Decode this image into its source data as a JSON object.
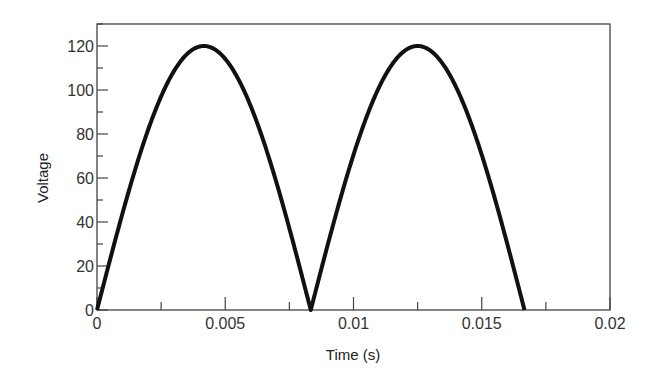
{
  "chart_data": {
    "type": "line",
    "title": "",
    "xlabel": "Time (s)",
    "ylabel": "Voltage",
    "xlim": [
      0,
      0.02
    ],
    "ylim": [
      0,
      130
    ],
    "x_ticks": [
      0,
      0.005,
      0.01,
      0.015,
      0.02
    ],
    "x_tick_labels": [
      "0",
      "0.005",
      "0.01",
      "0.015",
      "0.02"
    ],
    "x_minor_step": 0.0025,
    "y_ticks": [
      0,
      20,
      40,
      60,
      80,
      100,
      120
    ],
    "y_tick_labels": [
      "0",
      "20",
      "40",
      "60",
      "80",
      "100",
      "120"
    ],
    "y_minor_step": 10,
    "grid": false,
    "legend": null,
    "series": [
      {
        "name": "Full-wave rectified voltage",
        "description": "v(t) = |120 sin(2*pi*60*t)| for 0 <= t <= 1/60 s",
        "amplitude": 120,
        "frequency_hz": 60,
        "t_start": 0,
        "t_end": 0.016667,
        "x": [
          0,
          0.001,
          0.002,
          0.003,
          0.004167,
          0.005,
          0.006,
          0.007,
          0.008,
          0.008333,
          0.009,
          0.01,
          0.011,
          0.0125,
          0.013,
          0.014,
          0.015,
          0.016,
          0.016667
        ],
        "values": [
          0,
          44.6,
          82.8,
          108.9,
          120,
          114.1,
          93.3,
          58.9,
          15.7,
          0,
          30.9,
          70.5,
          102.8,
          120,
          118.2,
          102.8,
          70.5,
          30.9,
          0
        ],
        "color": "#111111"
      }
    ],
    "annotations": []
  }
}
